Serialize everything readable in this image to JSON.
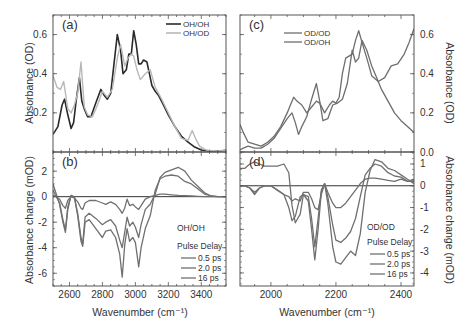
{
  "figure": {
    "width": 465,
    "height": 328,
    "colors": {
      "axis": "#555555",
      "text": "#333333",
      "oh_oh": "#2a2a2a",
      "oh_od": "#b8b8b8",
      "od_od": "#6e6e6e",
      "od_oh": "#6e6e6e",
      "delay": "#707070",
      "zero_line": "#333333"
    }
  },
  "chart_data": [
    {
      "id": "a",
      "type": "line",
      "panel_label": "(a)",
      "xlabel": "",
      "ylabel": "Absorbance (OD)",
      "xlim": [
        2500,
        3550
      ],
      "ylim": [
        0.0,
        0.7
      ],
      "yticks": [
        0.2,
        0.4,
        0.6
      ],
      "ytick_labels": [
        "0.2",
        "0.4",
        "0.6"
      ],
      "xticks": [
        2600,
        2800,
        3000,
        3200,
        3400
      ],
      "legend": [
        "OH/OH",
        "OH/OD"
      ],
      "legend_position": "upper right",
      "series": [
        {
          "name": "OH/OH",
          "color": "#2a2a2a",
          "width": 1.6,
          "x": [
            2500,
            2530,
            2555,
            2570,
            2590,
            2610,
            2625,
            2640,
            2660,
            2675,
            2690,
            2710,
            2730,
            2760,
            2790,
            2810,
            2830,
            2850,
            2870,
            2890,
            2910,
            2925,
            2945,
            2960,
            2975,
            2990,
            3005,
            3020,
            3035,
            3050,
            3070,
            3085,
            3100,
            3120,
            3140,
            3170,
            3200,
            3240,
            3280,
            3320,
            3360,
            3400,
            3440,
            3480,
            3520,
            3550
          ],
          "y": [
            0.09,
            0.13,
            0.24,
            0.27,
            0.19,
            0.12,
            0.15,
            0.26,
            0.38,
            0.26,
            0.22,
            0.18,
            0.18,
            0.25,
            0.32,
            0.29,
            0.27,
            0.3,
            0.45,
            0.6,
            0.52,
            0.4,
            0.42,
            0.5,
            0.5,
            0.62,
            0.55,
            0.45,
            0.45,
            0.47,
            0.46,
            0.4,
            0.34,
            0.31,
            0.29,
            0.24,
            0.19,
            0.13,
            0.08,
            0.05,
            0.025,
            0.01,
            0.005,
            0.003,
            0.005,
            0.01
          ]
        },
        {
          "name": "OH/OD",
          "color": "#b8b8b8",
          "width": 1.4,
          "x": [
            2500,
            2525,
            2545,
            2565,
            2590,
            2610,
            2630,
            2650,
            2670,
            2690,
            2710,
            2740,
            2770,
            2800,
            2830,
            2860,
            2890,
            2910,
            2935,
            2955,
            2975,
            2990,
            3010,
            3030,
            3060,
            3090,
            3120,
            3160,
            3200,
            3240,
            3280,
            3320,
            3345,
            3365,
            3390,
            3430,
            3480,
            3520,
            3550
          ],
          "y": [
            0.39,
            0.33,
            0.32,
            0.36,
            0.22,
            0.2,
            0.24,
            0.3,
            0.46,
            0.23,
            0.19,
            0.18,
            0.24,
            0.31,
            0.28,
            0.32,
            0.48,
            0.55,
            0.44,
            0.48,
            0.5,
            0.49,
            0.42,
            0.37,
            0.4,
            0.42,
            0.33,
            0.27,
            0.2,
            0.13,
            0.07,
            0.06,
            0.11,
            0.07,
            0.03,
            0.01,
            0.005,
            0.005,
            0.01
          ]
        }
      ]
    },
    {
      "id": "b",
      "type": "line",
      "panel_label": "(b)",
      "xlabel": "Wavenumber (cm⁻¹)",
      "ylabel": "Absorbance change (mOD)",
      "xlim": [
        2500,
        3550
      ],
      "ylim": [
        -7.0,
        3.5
      ],
      "yticks": [
        -6,
        -4,
        -2,
        0,
        2
      ],
      "ytick_labels": [
        "-6",
        "-4",
        "-2",
        "0",
        "2"
      ],
      "xticks": [
        2600,
        2800,
        3000,
        3200,
        3400
      ],
      "xtick_labels": [
        "2600",
        "2800",
        "3000",
        "3200",
        "3400"
      ],
      "annotation": "OH/OH",
      "legend_title": "Pulse Delay",
      "legend": [
        "0.5 ps",
        "2.0 ps",
        "16 ps"
      ],
      "series": [
        {
          "name": "0.5 ps",
          "color": "#707070",
          "x": [
            2500,
            2520,
            2540,
            2560,
            2575,
            2590,
            2610,
            2630,
            2650,
            2670,
            2680,
            2695,
            2720,
            2760,
            2800,
            2820,
            2850,
            2880,
            2905,
            2920,
            2935,
            2950,
            2965,
            2985,
            3000,
            3020,
            3035,
            3060,
            3090,
            3120,
            3150,
            3180,
            3220,
            3260,
            3300,
            3340,
            3380,
            3420,
            3460,
            3500,
            3550
          ],
          "y": [
            1.0,
            0.2,
            -0.6,
            -2.0,
            -2.8,
            -1.0,
            0.1,
            0.0,
            -1.5,
            -3.5,
            -3.9,
            -2.0,
            -1.8,
            -2.5,
            -3.2,
            -2.7,
            -2.6,
            -3.2,
            -4.5,
            -6.3,
            -3.8,
            -2.5,
            -3.5,
            -3.2,
            -3.6,
            -5.5,
            -4.0,
            -2.5,
            -1.5,
            0.5,
            1.4,
            1.6,
            1.7,
            1.6,
            1.2,
            1.0,
            0.6,
            0.2,
            0.05,
            0.0,
            0.0
          ]
        },
        {
          "name": "2.0 ps",
          "color": "#707070",
          "x": [
            2500,
            2520,
            2540,
            2560,
            2575,
            2590,
            2610,
            2630,
            2650,
            2670,
            2680,
            2695,
            2720,
            2760,
            2800,
            2820,
            2850,
            2880,
            2905,
            2920,
            2935,
            2950,
            2965,
            2985,
            3000,
            3020,
            3035,
            3060,
            3090,
            3120,
            3150,
            3180,
            3220,
            3260,
            3300,
            3340,
            3380,
            3420,
            3460,
            3500,
            3550
          ],
          "y": [
            0.5,
            0.0,
            -0.5,
            -1.8,
            -2.6,
            -0.8,
            0.1,
            -0.1,
            -1.3,
            -3.2,
            -3.7,
            -1.6,
            -1.3,
            -1.7,
            -2.2,
            -2.0,
            -1.8,
            -2.3,
            -3.4,
            -4.0,
            -2.8,
            -1.6,
            -2.3,
            -2.0,
            -2.4,
            -3.2,
            -2.2,
            -1.0,
            -0.6,
            0.2,
            1.5,
            1.9,
            2.1,
            2.3,
            2.0,
            1.3,
            0.8,
            0.3,
            0.05,
            0.0,
            0.0
          ]
        },
        {
          "name": "16 ps",
          "color": "#707070",
          "x": [
            2500,
            2520,
            2540,
            2560,
            2575,
            2590,
            2610,
            2630,
            2650,
            2670,
            2680,
            2695,
            2720,
            2760,
            2800,
            2820,
            2850,
            2880,
            2905,
            2920,
            2935,
            2950,
            2965,
            2985,
            3000,
            3020,
            3035,
            3060,
            3090,
            3120,
            3150,
            3180,
            3220,
            3260,
            3300,
            3340,
            3380,
            3420,
            3460,
            3500,
            3550
          ],
          "y": [
            0.1,
            0.0,
            -0.2,
            -0.7,
            -0.9,
            -0.3,
            0.0,
            -0.1,
            -0.4,
            -0.9,
            -1.0,
            -0.5,
            -0.3,
            -0.3,
            -0.5,
            -0.6,
            -0.4,
            -0.6,
            -1.0,
            -1.3,
            -0.9,
            -0.2,
            -0.7,
            -0.6,
            -0.8,
            -1.0,
            -0.7,
            -0.2,
            0.0,
            0.1,
            0.2,
            0.2,
            0.15,
            0.1,
            0.08,
            0.05,
            0.03,
            0.0,
            0.0,
            0.0,
            0.0
          ]
        }
      ]
    },
    {
      "id": "c",
      "type": "line",
      "panel_label": "(c)",
      "xlabel": "",
      "ylabel": "Absorbance (OD)",
      "y_axis_side": "right",
      "xlim": [
        1905,
        2440
      ],
      "ylim": [
        0.0,
        0.7
      ],
      "yticks": [
        0.0,
        0.2,
        0.4,
        0.6
      ],
      "ytick_labels": [
        "0.0",
        "0.2",
        "0.4",
        "0.6"
      ],
      "xticks": [
        2000,
        2200,
        2400
      ],
      "legend": [
        "OD/OD",
        "OD/OH"
      ],
      "legend_position": "upper left",
      "series": [
        {
          "name": "OD/OD",
          "color": "#6e6e6e",
          "x": [
            1905,
            1915,
            1930,
            1950,
            1970,
            1990,
            2010,
            2030,
            2050,
            2060,
            2070,
            2080,
            2095,
            2110,
            2125,
            2140,
            2150,
            2165,
            2180,
            2190,
            2200,
            2210,
            2220,
            2230,
            2240,
            2250,
            2260,
            2270,
            2280,
            2295,
            2310,
            2330,
            2350,
            2370,
            2390,
            2410,
            2425,
            2440
          ],
          "y": [
            0.14,
            0.1,
            0.05,
            0.04,
            0.03,
            0.05,
            0.08,
            0.13,
            0.2,
            0.24,
            0.28,
            0.26,
            0.24,
            0.2,
            0.23,
            0.26,
            0.25,
            0.2,
            0.24,
            0.26,
            0.25,
            0.28,
            0.4,
            0.48,
            0.49,
            0.5,
            0.57,
            0.62,
            0.56,
            0.48,
            0.39,
            0.36,
            0.38,
            0.44,
            0.45,
            0.5,
            0.56,
            0.63
          ]
        },
        {
          "name": "OD/OH",
          "color": "#6e6e6e",
          "x": [
            1905,
            1915,
            1930,
            1950,
            1970,
            1990,
            2010,
            2030,
            2050,
            2065,
            2075,
            2085,
            2095,
            2110,
            2125,
            2140,
            2150,
            2160,
            2175,
            2190,
            2205,
            2220,
            2235,
            2250,
            2260,
            2270,
            2280,
            2295,
            2310,
            2325,
            2340,
            2360,
            2380,
            2400,
            2420,
            2440
          ],
          "y": [
            0.01,
            0.02,
            0.03,
            0.02,
            0.02,
            0.04,
            0.07,
            0.12,
            0.17,
            0.2,
            0.15,
            0.09,
            0.13,
            0.18,
            0.27,
            0.35,
            0.26,
            0.16,
            0.17,
            0.24,
            0.25,
            0.27,
            0.35,
            0.52,
            0.46,
            0.48,
            0.57,
            0.52,
            0.44,
            0.38,
            0.32,
            0.26,
            0.2,
            0.16,
            0.13,
            0.1
          ]
        }
      ]
    },
    {
      "id": "d",
      "type": "line",
      "panel_label": "(d)",
      "xlabel": "Wavenumber (cm⁻¹)",
      "ylabel": "Absorbance change (mOD)",
      "y_axis_side": "right",
      "xlim": [
        1905,
        2440
      ],
      "ylim": [
        -4.6,
        1.55
      ],
      "yticks": [
        -4,
        -3,
        -2,
        -1,
        0,
        1
      ],
      "ytick_labels": [
        "-4",
        "-3",
        "-2",
        "-1",
        "0",
        "1"
      ],
      "xticks": [
        2000,
        2200,
        2400
      ],
      "xtick_labels": [
        "2000",
        "2200",
        "2400"
      ],
      "annotation": "OD/OD",
      "legend_title": "Pulse Delay",
      "legend": [
        "0.5 ps",
        "2.0 ps",
        "16 ps"
      ],
      "series": [
        {
          "name": "0.5 ps",
          "color": "#707070",
          "x": [
            1905,
            1920,
            1935,
            1950,
            1965,
            1980,
            2000,
            2020,
            2040,
            2055,
            2065,
            2075,
            2090,
            2100,
            2115,
            2125,
            2135,
            2145,
            2155,
            2165,
            2175,
            2190,
            2200,
            2215,
            2230,
            2245,
            2260,
            2275,
            2290,
            2305,
            2320,
            2340,
            2360,
            2380,
            2400,
            2420,
            2440
          ],
          "y": [
            0.0,
            0.0,
            -0.1,
            -0.4,
            -0.1,
            0.0,
            0.0,
            -0.2,
            -0.4,
            -0.5,
            -0.7,
            -0.6,
            -0.7,
            -0.3,
            -0.3,
            -0.6,
            -1.0,
            -1.1,
            -0.4,
            0.1,
            -0.3,
            -0.8,
            -1.0,
            -1.0,
            -0.8,
            -0.5,
            -0.2,
            0.1,
            0.3,
            0.35,
            0.35,
            0.3,
            0.25,
            0.2,
            0.3,
            0.2,
            0.3
          ]
        },
        {
          "name": "2.0 ps",
          "color": "#707070",
          "x": [
            1905,
            1920,
            1935,
            1950,
            1965,
            1980,
            2000,
            2020,
            2040,
            2055,
            2065,
            2075,
            2090,
            2100,
            2115,
            2125,
            2135,
            2145,
            2155,
            2165,
            2175,
            2190,
            2200,
            2215,
            2230,
            2245,
            2260,
            2275,
            2290,
            2305,
            2320,
            2340,
            2360,
            2380,
            2400,
            2420,
            2440
          ],
          "y": [
            0.0,
            0.0,
            -0.1,
            -0.3,
            -0.1,
            0.0,
            0.0,
            -0.2,
            -0.4,
            -1.0,
            -1.6,
            -1.4,
            -0.5,
            -0.4,
            -0.5,
            -1.5,
            -2.8,
            -1.5,
            -0.2,
            0.1,
            -0.5,
            -1.8,
            -2.5,
            -2.6,
            -2.4,
            -2.1,
            -1.5,
            -0.5,
            0.5,
            0.8,
            1.0,
            0.9,
            0.6,
            0.45,
            0.4,
            0.2,
            0.2
          ]
        },
        {
          "name": "16 ps",
          "color": "#707070",
          "x": [
            1905,
            1920,
            1935,
            1950,
            1965,
            1980,
            2000,
            2020,
            2040,
            2055,
            2065,
            2075,
            2090,
            2100,
            2115,
            2125,
            2135,
            2145,
            2155,
            2165,
            2175,
            2190,
            2200,
            2215,
            2230,
            2245,
            2260,
            2275,
            2290,
            2305,
            2320,
            2340,
            2360,
            2380,
            2400,
            2420,
            2440
          ],
          "y": [
            0.8,
            0.8,
            1.0,
            1.1,
            1.0,
            0.9,
            0.9,
            0.9,
            1.0,
            0.6,
            -0.9,
            -1.7,
            -1.3,
            -0.4,
            -0.7,
            -2.0,
            -3.4,
            -2.0,
            -0.3,
            0.1,
            -0.8,
            -2.8,
            -3.5,
            -3.6,
            -3.3,
            -3.0,
            -3.2,
            -2.2,
            -0.3,
            0.7,
            1.2,
            1.1,
            0.8,
            0.7,
            0.5,
            0.3,
            0.1
          ]
        }
      ]
    }
  ]
}
